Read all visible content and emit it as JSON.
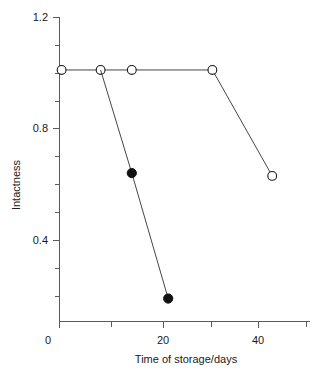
{
  "chart_data": {
    "type": "line",
    "title": "",
    "xlabel": "Time of storage/days",
    "ylabel": "Intactness",
    "xlim": [
      -0.8,
      48
    ],
    "ylim": [
      0.0,
      1.2
    ],
    "grid": false,
    "legend": "none",
    "x_ticks_major": [
      0,
      20,
      40
    ],
    "x_ticks_major_labels": [
      "0",
      "20",
      "40"
    ],
    "x_ticks_minor": [
      10,
      30
    ],
    "y_ticks_major": [
      0.4,
      0.8,
      1.2
    ],
    "y_ticks_major_labels": [
      "0.4",
      "0.8",
      "1.2"
    ],
    "y_ticks_minor": [
      0.1,
      0.2,
      0.3,
      0.5,
      0.6,
      0.7,
      0.9,
      1.0,
      1.1
    ],
    "series": [
      {
        "name": "open-circles",
        "marker": "open-circle",
        "marker_color": "#ffffff",
        "line_color": "#33302e",
        "points": [
          {
            "x": 0.5,
            "y": 1.01
          },
          {
            "x": 8.0,
            "y": 1.01
          },
          {
            "x": 14.0,
            "y": 1.01
          },
          {
            "x": 29.5,
            "y": 1.01
          },
          {
            "x": 41.0,
            "y": 0.63
          }
        ]
      },
      {
        "name": "filled-circles",
        "marker": "filled-circle",
        "marker_color": "#111111",
        "line_color": "#33302e",
        "points": [
          {
            "x": 8.0,
            "y": 1.01
          },
          {
            "x": 14.0,
            "y": 0.64
          },
          {
            "x": 21.0,
            "y": 0.19
          }
        ]
      }
    ]
  },
  "labels": {
    "x_axis_title": "Time of storage/days",
    "y_axis_title": "Intactness",
    "x_tick_0": "0",
    "x_tick_20": "20",
    "x_tick_40": "40",
    "y_tick_04": "0.4",
    "y_tick_08": "0.8",
    "y_tick_12": "1.2"
  },
  "colors": {
    "axis": "#5a5a5a",
    "line": "#33302e",
    "marker_fill_open": "#ffffff",
    "marker_fill_closed": "#111111",
    "text": "#1a1a1a",
    "background": "#ffffff"
  }
}
